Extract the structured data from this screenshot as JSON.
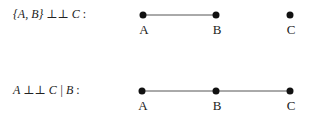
{
  "rows": [
    {
      "statement": {
        "left": "{A, B}",
        "op": "⊥⊥",
        "right": "C",
        "cond": "",
        "suffix": ":"
      },
      "y": 15,
      "nodes": [
        {
          "label": "A",
          "x": 143
        },
        {
          "label": "B",
          "x": 216
        },
        {
          "label": "C",
          "x": 290
        }
      ],
      "edges": [
        [
          "A",
          "B"
        ]
      ]
    },
    {
      "statement": {
        "left": "A",
        "op": "⊥⊥",
        "right": "C",
        "cond": "| B",
        "suffix": ":"
      },
      "y": 91,
      "nodes": [
        {
          "label": "A",
          "x": 142
        },
        {
          "label": "B",
          "x": 216
        },
        {
          "label": "C",
          "x": 290
        }
      ],
      "edges": [
        [
          "A",
          "B"
        ],
        [
          "B",
          "C"
        ]
      ]
    }
  ]
}
